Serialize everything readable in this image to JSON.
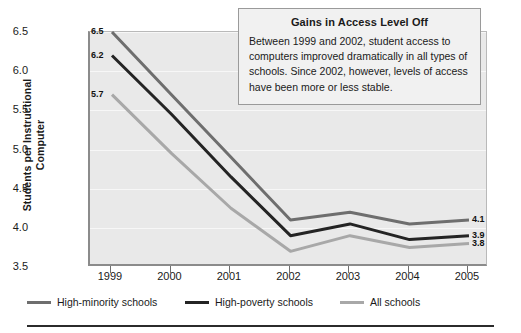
{
  "chart_data": {
    "type": "line",
    "title": "",
    "xlabel": "",
    "ylabel": "Students per Instructional Computer",
    "ylabel_lines": [
      "Students per Instructional",
      "Computer"
    ],
    "categories": [
      "1999",
      "2000",
      "2001",
      "2002",
      "2003",
      "2004",
      "2005"
    ],
    "x": [
      1999,
      2000,
      2001,
      2002,
      2003,
      2004,
      2005
    ],
    "ylim": [
      3.5,
      6.5
    ],
    "yticks": [
      "6.5",
      "6.0",
      "5.5",
      "5.0",
      "4.5",
      "4.0",
      "3.5"
    ],
    "ytick_values": [
      6.5,
      6.0,
      5.5,
      5.0,
      4.5,
      4.0,
      3.5
    ],
    "grid": true,
    "legend_position": "bottom",
    "series": [
      {
        "name": "High-minority schools",
        "color": "#6e6e6e",
        "values": [
          6.5,
          5.7,
          4.9,
          4.1,
          4.2,
          4.05,
          4.1
        ],
        "start_label": "6.5",
        "end_label": "4.1"
      },
      {
        "name": "High-poverty schools",
        "color": "#242424",
        "values": [
          6.2,
          5.45,
          4.65,
          3.9,
          4.05,
          3.85,
          3.9
        ],
        "start_label": "6.2",
        "end_label": "3.9"
      },
      {
        "name": "All schools",
        "color": "#a8a8a8",
        "values": [
          5.7,
          4.95,
          4.25,
          3.7,
          3.9,
          3.75,
          3.8
        ],
        "start_label": "5.7",
        "end_label": "3.8"
      }
    ]
  },
  "callout": {
    "title": "Gains in Access Level Off",
    "body": "Between 1999 and 2002, student access to computers improved dramatically in all types of schools. Since 2002, however, levels of access have been more or less stable."
  },
  "colors": {
    "plot_background": "#e9e9e9",
    "gridline": "#f7f7f7",
    "axis": "#8b8b8b",
    "callout_background": "#f1f1f1",
    "rule": "#2b2b2b"
  }
}
